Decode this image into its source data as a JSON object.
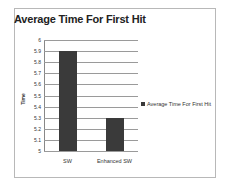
{
  "chart_data": {
    "type": "bar",
    "title": "Average Time For First Hit",
    "xlabel": "",
    "ylabel": "Time",
    "categories": [
      "SW",
      "Enhanced SW"
    ],
    "series": [
      {
        "name": "Average Time For First Hit",
        "values": [
          5.9,
          5.3
        ],
        "color": "#3a3a3a"
      }
    ],
    "ylim": [
      5,
      6
    ],
    "yticks": [
      "6",
      "5.9",
      "5.8",
      "5.7",
      "5.6",
      "5.5",
      "5.4",
      "5.3",
      "5.2",
      "5.1",
      "5"
    ],
    "grid": true,
    "legend_position": "right"
  }
}
